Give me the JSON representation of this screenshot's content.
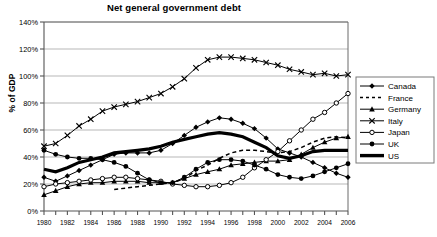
{
  "chart_data": {
    "type": "line",
    "title": "Net general government debt",
    "xlabel": "",
    "ylabel": "% of GDP",
    "grid": true,
    "legend_position": "right",
    "ylim": [
      0,
      140
    ],
    "ytick_labels": [
      "0%",
      "20%",
      "40%",
      "60%",
      "80%",
      "100%",
      "120%",
      "140%"
    ],
    "ytick_values": [
      0,
      20,
      40,
      60,
      80,
      100,
      120,
      140
    ],
    "xlim": [
      1980,
      2006
    ],
    "x": [
      1980,
      1981,
      1982,
      1983,
      1984,
      1985,
      1986,
      1987,
      1988,
      1989,
      1990,
      1991,
      1992,
      1993,
      1994,
      1995,
      1996,
      1997,
      1998,
      1999,
      2000,
      2001,
      2002,
      2003,
      2004,
      2005,
      2006
    ],
    "xtick_labels": [
      "1980",
      "1982",
      "1984",
      "1986",
      "1988",
      "1990",
      "1992",
      "1994",
      "1996",
      "1998",
      "2000",
      "2002",
      "2004",
      "2006"
    ],
    "xtick_values": [
      1980,
      1982,
      1984,
      1986,
      1988,
      1990,
      1992,
      1994,
      1996,
      1998,
      2000,
      2002,
      2004,
      2006
    ],
    "series": [
      {
        "name": "Canada",
        "marker": "diamond",
        "style": "solid",
        "values": [
          25,
          22,
          26,
          30,
          34,
          38,
          42,
          43,
          43,
          43,
          45,
          50,
          56,
          62,
          66,
          69,
          68,
          65,
          61,
          54,
          46,
          43,
          40,
          36,
          32,
          28,
          25
        ]
      },
      {
        "name": "France",
        "marker": "none",
        "style": "dashed",
        "values": [
          null,
          null,
          null,
          null,
          null,
          null,
          16,
          17,
          18,
          19,
          20,
          21,
          24,
          30,
          34,
          39,
          43,
          45,
          45,
          44,
          43,
          44,
          47,
          51,
          54,
          55,
          54
        ]
      },
      {
        "name": "Germany",
        "marker": "triangle",
        "style": "solid",
        "values": [
          12,
          15,
          18,
          20,
          21,
          21,
          22,
          22,
          22,
          21,
          21,
          21,
          24,
          27,
          29,
          31,
          34,
          35,
          36,
          37,
          37,
          38,
          42,
          47,
          51,
          54,
          55
        ]
      },
      {
        "name": "Italy",
        "marker": "x",
        "style": "solid",
        "values": [
          48,
          50,
          56,
          63,
          68,
          74,
          77,
          79,
          81,
          84,
          87,
          92,
          98,
          106,
          112,
          114,
          114,
          113,
          112,
          110,
          108,
          105,
          103,
          101,
          102,
          100,
          101
        ]
      },
      {
        "name": "Japan",
        "marker": "open-circle",
        "style": "solid",
        "values": [
          18,
          20,
          21,
          22,
          23,
          24,
          25,
          25,
          24,
          23,
          22,
          20,
          19,
          18,
          18,
          19,
          21,
          25,
          32,
          38,
          44,
          52,
          60,
          68,
          73,
          80,
          87
        ]
      },
      {
        "name": "UK",
        "marker": "circle",
        "style": "solid",
        "values": [
          45,
          42,
          40,
          39,
          39,
          38,
          36,
          33,
          28,
          23,
          21,
          21,
          25,
          31,
          36,
          38,
          38,
          37,
          34,
          31,
          27,
          25,
          24,
          26,
          29,
          32,
          35
        ]
      },
      {
        "name": "US",
        "marker": "none",
        "style": "thick",
        "values": [
          31,
          29,
          32,
          36,
          38,
          40,
          43,
          44,
          45,
          46,
          48,
          51,
          53,
          55,
          57,
          58,
          57,
          55,
          51,
          47,
          41,
          39,
          41,
          44,
          45,
          45,
          45
        ]
      }
    ]
  }
}
